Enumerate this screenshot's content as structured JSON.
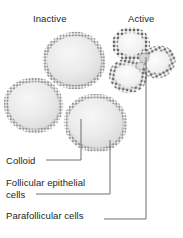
{
  "figure": {
    "background_color": "#ffffff",
    "text_color": "#231f20",
    "leader_line_color": "#6d6e71"
  },
  "columns": [
    {
      "id": "inactive",
      "label": "Inactive"
    },
    {
      "id": "active",
      "label": "Active"
    }
  ],
  "labels": [
    {
      "id": "colloid",
      "text": "Colloid"
    },
    {
      "id": "follicular-epithelial-cells",
      "line1": "Follicular epithelial",
      "line2": "cells"
    },
    {
      "id": "parafollicular-cells",
      "text": "Parafollicular cells"
    }
  ],
  "structures": {
    "inactive_follicles": [
      {
        "id": "follicle-top",
        "cx": 74,
        "cy": 60,
        "rx": 29,
        "ry": 26,
        "colloid_fill": "#e8e8e8",
        "epithelium_color": "#8c8c8c"
      },
      {
        "id": "follicle-left",
        "cx": 33,
        "cy": 105,
        "rx": 27,
        "ry": 25,
        "colloid_fill": "#e8e8e8",
        "epithelium_color": "#8c8c8c"
      },
      {
        "id": "follicle-bottom-right",
        "cx": 95,
        "cy": 123,
        "rx": 29,
        "ry": 27,
        "colloid_fill": "#e8e8e8",
        "epithelium_color": "#8c8c8c"
      }
    ],
    "active_follicles": [
      {
        "id": "active-follicle-top",
        "cx": 131,
        "cy": 44,
        "rx": 16,
        "ry": 14,
        "colloid_fill": "#f2f2f2",
        "epithelium_color": "#6b6b6b"
      },
      {
        "id": "active-follicle-right",
        "cx": 158,
        "cy": 62,
        "rx": 15,
        "ry": 13,
        "colloid_fill": "#f2f2f2",
        "epithelium_color": "#6b6b6b"
      },
      {
        "id": "active-follicle-bottom",
        "cx": 128,
        "cy": 76,
        "rx": 16,
        "ry": 14,
        "colloid_fill": "#f2f2f2",
        "epithelium_color": "#6b6b6b"
      }
    ]
  },
  "leader_lines": [
    {
      "id": "colloid-leader",
      "path": "M 46 160 L 81 160 L 81 119"
    },
    {
      "id": "follicular-epithelial-leader",
      "path": "M 36 194 L 110 194 L 110 140"
    },
    {
      "id": "parafollicular-leader",
      "path": "M 104 219 L 146 219 L 146 57"
    }
  ]
}
